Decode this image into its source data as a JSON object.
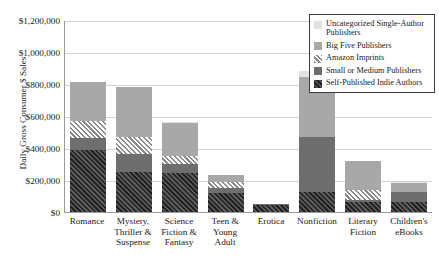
{
  "chart_data": {
    "type": "bar",
    "subtype": "stacked-bar",
    "title": "",
    "xlabel": "",
    "ylabel": "Daily Gross Consumer $ Sales",
    "ylim": [
      0,
      1200000
    ],
    "ytick_step": 200000,
    "ytick_labels": [
      "$1,200,000",
      "$1,000,000",
      "$800,000",
      "$600,000",
      "$400,000",
      "$200,000",
      "$0"
    ],
    "ytick_values": [
      1200000,
      1000000,
      800000,
      600000,
      400000,
      200000,
      0
    ],
    "grid": "horizontal",
    "legend_position": "top-right",
    "categories": [
      "Romance",
      "Mystery, Thriller & Suspense",
      "Science Fiction & Fantasy",
      "Teen & Young Adult",
      "Erotica",
      "Nonfiction",
      "Literary Fiction",
      "Children's eBooks"
    ],
    "series": [
      {
        "name": "Self-Published Indie Authors",
        "style": "dark-hatch",
        "color": "#232323",
        "values": [
          390000,
          250000,
          245000,
          120000,
          45000,
          125000,
          60000,
          60000
        ]
      },
      {
        "name": "Small or Medium Publishers",
        "style": "solid-dark-gray",
        "color": "#6e6e6e",
        "values": [
          75000,
          110000,
          55000,
          30000,
          5000,
          345000,
          15000,
          65000
        ]
      },
      {
        "name": "Amazon Imprints",
        "style": "hatch",
        "color": "#8a8a8a",
        "values": [
          105000,
          110000,
          50000,
          35000,
          0,
          0,
          60000,
          0
        ]
      },
      {
        "name": "Big Five Publishers",
        "style": "solid-gray",
        "color": "#a8a8a8",
        "values": [
          240000,
          310000,
          205000,
          45000,
          0,
          375000,
          185000,
          55000
        ]
      },
      {
        "name": "Uncategorized Single-Author Publishers",
        "style": "solid-light",
        "color": "#e2e2e2",
        "values": [
          0,
          0,
          10000,
          0,
          0,
          35000,
          0,
          10000
        ]
      }
    ],
    "totals": [
      810000,
      780000,
      565000,
      230000,
      50000,
      880000,
      320000,
      190000
    ]
  },
  "legend": {
    "items": [
      {
        "label": "Uncategorized Single-Author Publishers",
        "swatch": "light-gray-swatch"
      },
      {
        "label": "Big Five Publishers",
        "swatch": "gray-swatch"
      },
      {
        "label": "Amazon Imprints",
        "swatch": "hatched-swatch"
      },
      {
        "label": "Small or Medium Publishers",
        "swatch": "dark-gray-swatch"
      },
      {
        "label": "Self-Published Indie Authors",
        "swatch": "dark-hatched-swatch"
      }
    ]
  }
}
